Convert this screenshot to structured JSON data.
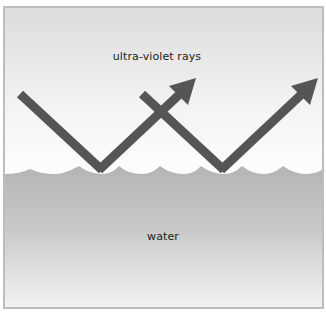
{
  "diagram": {
    "labels": {
      "air": "ultra-violet rays",
      "water": "water"
    },
    "colors": {
      "border": "#bdbdbd",
      "sky_top": "#dcdcdc",
      "sky_bottom": "#ffffff",
      "water_top": "#b4b4b4",
      "water_bottom": "#f2f2f2",
      "ray": "#555555",
      "text": "#222222"
    },
    "rays": [
      {
        "name": "ray-1",
        "incoming_start": [
          18,
          92
        ],
        "reflection_point": [
          100,
          170
        ],
        "outgoing_tip": [
          193,
          77
        ]
      },
      {
        "name": "ray-2",
        "incoming_start": [
          140,
          92
        ],
        "reflection_point": [
          222,
          170
        ],
        "outgoing_tip": [
          315,
          77
        ]
      }
    ],
    "waterline_y": 172
  }
}
